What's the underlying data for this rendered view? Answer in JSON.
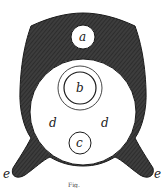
{
  "figure": {
    "labels": {
      "a": "a",
      "b": "b",
      "c": "c",
      "d_left": "d",
      "d_right": "d",
      "e_left": "e",
      "e_right": "e"
    },
    "caption": "Fig.",
    "colors": {
      "body": "#3a3a3a",
      "body_hatch": "#2a2a2a",
      "openings": "#ffffff",
      "stroke": "#1a1a1a"
    }
  }
}
